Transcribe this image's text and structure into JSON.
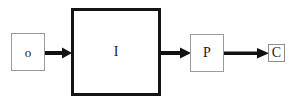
{
  "diagram": {
    "background_color": "#ffffff",
    "nodes": [
      {
        "id": "o",
        "label": "o",
        "shape": "rectangle",
        "border_color": "#9a9a9a",
        "border_width": 1,
        "fill": "#ffffff"
      },
      {
        "id": "i",
        "label": "I",
        "shape": "rectangle",
        "border_color": "#141414",
        "border_width": 3,
        "fill": "#ffffff"
      },
      {
        "id": "p",
        "label": "P",
        "shape": "rectangle",
        "border_color": "#9a9a9a",
        "border_width": 1,
        "fill": "#ffffff"
      },
      {
        "id": "c",
        "label": "C",
        "shape": "rectangle",
        "border_color": "#8c8c8c",
        "border_width": 1,
        "fill": "#ffffff"
      }
    ],
    "edges": [
      {
        "id": "o-i",
        "from": "o",
        "to": "i",
        "label": "",
        "style": "solid-arrow",
        "color": "#111111"
      },
      {
        "id": "i-p",
        "from": "i",
        "to": "p",
        "label": "",
        "style": "solid-arrow",
        "color": "#111111"
      },
      {
        "id": "p-c",
        "from": "p",
        "to": "c",
        "label": "",
        "style": "solid-arrow",
        "color": "#111111"
      }
    ]
  }
}
